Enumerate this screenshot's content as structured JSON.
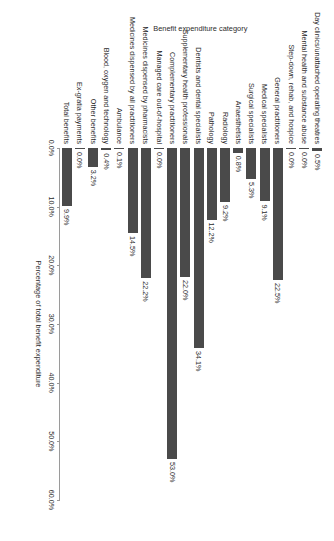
{
  "chart_data": {
    "type": "bar",
    "orientation": "horizontal",
    "title": "",
    "xlabel": "Percentage of total benefit expenditure",
    "ylabel": "Benefit expenditure category",
    "xlim": [
      0,
      60
    ],
    "xticks": [
      "0.0%",
      "10.0%",
      "20.0%",
      "30.0%",
      "40.0%",
      "50.0%",
      "60.0%"
    ],
    "xtick_values": [
      0,
      10,
      20,
      30,
      40,
      50,
      60
    ],
    "grid": false,
    "legend": "none",
    "bar_color": "#4a4a4a",
    "axis_color": "#9a9a9a",
    "categories": [
      "Day clinics/unattached operating theatres",
      "Mental health and substance abuse",
      "Step-down, rehab, and hospice",
      "General practitioners",
      "Medical specialists",
      "Surgical specialists",
      "Anaesthetists",
      "Radiology",
      "Pathology",
      "Dentists and dental specialists",
      "Supplementary health professionals",
      "Complementary practitioners",
      "Managed care out-of-hospital",
      "Medicines dispensed by pharmacists",
      "Medicines dispensed by all practitioners",
      "Ambulance",
      "Blood, oxygen and technology",
      "Other benefits",
      "Ex-gratia payments",
      "Total benefits"
    ],
    "values": [
      0.5,
      0.0,
      0.0,
      22.5,
      9.1,
      5.3,
      0.8,
      9.2,
      12.2,
      34.1,
      22.0,
      53.0,
      0.0,
      22.2,
      14.5,
      0.1,
      0.4,
      3.2,
      0.0,
      9.9
    ],
    "value_labels": [
      "0.5%",
      "0.0%",
      "0.0%",
      "22.5%",
      "9.1%",
      "5.3%",
      "0.8%",
      "9.2%",
      "12.2%",
      "34.1%",
      "22.0%",
      "53.0%",
      "0.0%",
      "22.2%",
      "14.5%",
      "0.1%",
      "0.4%",
      "3.2%",
      "0.0%",
      "9.9%"
    ]
  }
}
